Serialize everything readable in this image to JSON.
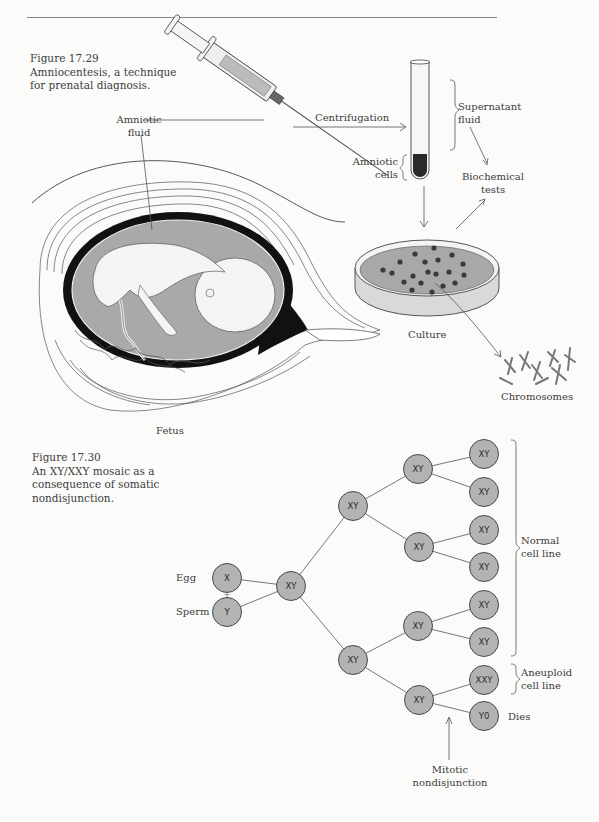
{
  "page": {
    "header_rule": true,
    "background": "#fbfbfa"
  },
  "figure_17_29": {
    "number": "Figure 17.29",
    "caption_line1": "Amniocentesis, a technique",
    "caption_line2": "for prenatal diagnosis.",
    "labels": {
      "amniotic_fluid_1": "Amniotic",
      "amniotic_fluid_2": "fluid",
      "centrifugation": "Centrifugation",
      "supernatant_1": "Supernatant",
      "supernatant_2": "fluid",
      "amniotic_cells_1": "Amniotic",
      "amniotic_cells_2": "cells",
      "biochemical_1": "Biochemical",
      "biochemical_2": "tests",
      "culture": "Culture",
      "chromosomes": "Chromosomes",
      "fetus": "Fetus"
    },
    "colors": {
      "fluid_gray": "#a9a9a9",
      "black_band": "#111111",
      "line": "#444444"
    }
  },
  "figure_17_30": {
    "number": "Figure 17.30",
    "caption_line1": "An XY/XXY mosaic as a",
    "caption_line2": "consequence of somatic",
    "caption_line3": "nondisjunction.",
    "labels": {
      "egg": "Egg",
      "plus": "+",
      "sperm": "Sperm",
      "normal_1": "Normal",
      "normal_2": "cell line",
      "aneuploid_1": "Aneuploid",
      "aneuploid_2": "cell line",
      "dies": "Dies",
      "mitotic_1": "Mitotic",
      "mitotic_2": "nondisjunction"
    },
    "nodes": {
      "egg": "X",
      "sperm": "Y",
      "zygote": "XY",
      "l2_top": "XY",
      "l2_bottom": "XY",
      "l3_a": "XY",
      "l3_b": "XY",
      "l3_c": "XY",
      "l3_d": "XY",
      "leaf_1": "XY",
      "leaf_2": "XY",
      "leaf_3": "XY",
      "leaf_4": "XY",
      "leaf_5": "XY",
      "leaf_6": "XY",
      "leaf_7": "XXY",
      "leaf_8": "Y0"
    },
    "colors": {
      "node_fill": "#b3b3b3",
      "node_stroke": "#3a3a3a"
    }
  }
}
